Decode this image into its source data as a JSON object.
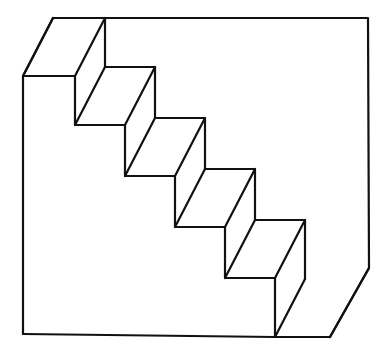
{
  "image": {
    "title": "Schroeder staircase illusion",
    "kind": "line-drawing",
    "width": 392,
    "height": 358,
    "background_color": "#ffffff",
    "line_color": "#111111",
    "face_color": "#ffffff",
    "line_width": 2.2,
    "step_count": 5,
    "depth_offset": {
      "dx": 30,
      "dy": -58
    }
  },
  "geometry": {
    "front_profile": [
      [
        23,
        76
      ],
      [
        75,
        76
      ],
      [
        75,
        125
      ],
      [
        125,
        125
      ],
      [
        125,
        176
      ],
      [
        175,
        176
      ],
      [
        175,
        227
      ],
      [
        225,
        227
      ],
      [
        225,
        278
      ],
      [
        275,
        278
      ],
      [
        275,
        337
      ]
    ],
    "back_profile": [
      [
        53,
        18
      ],
      [
        105,
        18
      ],
      [
        105,
        67
      ],
      [
        155,
        67
      ],
      [
        155,
        118
      ],
      [
        205,
        118
      ],
      [
        205,
        169
      ],
      [
        255,
        169
      ],
      [
        255,
        220
      ],
      [
        305,
        220
      ],
      [
        305,
        279
      ]
    ],
    "left_panel": [
      [
        23,
        76
      ],
      [
        53,
        18
      ],
      [
        53,
        18
      ],
      [
        23,
        76
      ],
      [
        23,
        334
      ]
    ],
    "bottom_edge": [
      [
        23,
        334
      ],
      [
        275,
        337
      ],
      [
        330,
        337
      ]
    ],
    "right_frame": [
      [
        105,
        18
      ],
      [
        368,
        18
      ],
      [
        369,
        268
      ],
      [
        330,
        337
      ]
    ],
    "depth_connectors": [
      [
        [
          23,
          76
        ],
        [
          53,
          18
        ]
      ],
      [
        [
          75,
          76
        ],
        [
          105,
          18
        ]
      ],
      [
        [
          75,
          125
        ],
        [
          105,
          67
        ]
      ],
      [
        [
          125,
          125
        ],
        [
          155,
          67
        ]
      ],
      [
        [
          125,
          176
        ],
        [
          155,
          118
        ]
      ],
      [
        [
          175,
          176
        ],
        [
          205,
          118
        ]
      ],
      [
        [
          175,
          227
        ],
        [
          205,
          169
        ]
      ],
      [
        [
          225,
          227
        ],
        [
          255,
          169
        ]
      ],
      [
        [
          225,
          278
        ],
        [
          255,
          220
        ]
      ],
      [
        [
          275,
          278
        ],
        [
          305,
          220
        ]
      ],
      [
        [
          275,
          337
        ],
        [
          305,
          279
        ]
      ],
      [
        [
          330,
          337
        ],
        [
          369,
          268
        ]
      ]
    ],
    "tread_faces": [
      [
        [
          23,
          76
        ],
        [
          53,
          18
        ],
        [
          105,
          18
        ],
        [
          75,
          76
        ]
      ],
      [
        [
          75,
          125
        ],
        [
          105,
          67
        ],
        [
          155,
          67
        ],
        [
          125,
          125
        ]
      ],
      [
        [
          125,
          176
        ],
        [
          155,
          118
        ],
        [
          205,
          118
        ],
        [
          175,
          176
        ]
      ],
      [
        [
          175,
          227
        ],
        [
          205,
          169
        ],
        [
          255,
          169
        ],
        [
          225,
          227
        ]
      ],
      [
        [
          225,
          278
        ],
        [
          255,
          220
        ],
        [
          305,
          220
        ],
        [
          275,
          278
        ]
      ]
    ],
    "riser_faces": [
      [
        [
          75,
          76
        ],
        [
          105,
          18
        ],
        [
          105,
          67
        ],
        [
          75,
          125
        ]
      ],
      [
        [
          125,
          125
        ],
        [
          155,
          67
        ],
        [
          155,
          118
        ],
        [
          125,
          176
        ]
      ],
      [
        [
          175,
          176
        ],
        [
          205,
          118
        ],
        [
          205,
          169
        ],
        [
          175,
          227
        ]
      ],
      [
        [
          225,
          227
        ],
        [
          255,
          169
        ],
        [
          255,
          220
        ],
        [
          225,
          278
        ]
      ],
      [
        [
          275,
          278
        ],
        [
          305,
          220
        ],
        [
          305,
          279
        ],
        [
          275,
          337
        ]
      ]
    ],
    "background_panel": [
      [
        105,
        18
      ],
      [
        368,
        18
      ],
      [
        369,
        268
      ],
      [
        330,
        337
      ],
      [
        275,
        337
      ],
      [
        275,
        278
      ],
      [
        305,
        220
      ],
      [
        255,
        220
      ],
      [
        255,
        169
      ],
      [
        205,
        169
      ],
      [
        205,
        118
      ],
      [
        155,
        118
      ],
      [
        155,
        67
      ],
      [
        105,
        67
      ]
    ],
    "left_wall": [
      [
        23,
        76
      ],
      [
        53,
        18
      ],
      [
        53,
        18
      ],
      [
        23,
        76
      ],
      [
        23,
        334
      ],
      [
        275,
        337
      ],
      [
        275,
        278
      ],
      [
        225,
        278
      ],
      [
        225,
        227
      ],
      [
        175,
        227
      ],
      [
        175,
        176
      ],
      [
        125,
        176
      ],
      [
        125,
        125
      ],
      [
        75,
        125
      ],
      [
        75,
        76
      ]
    ]
  }
}
